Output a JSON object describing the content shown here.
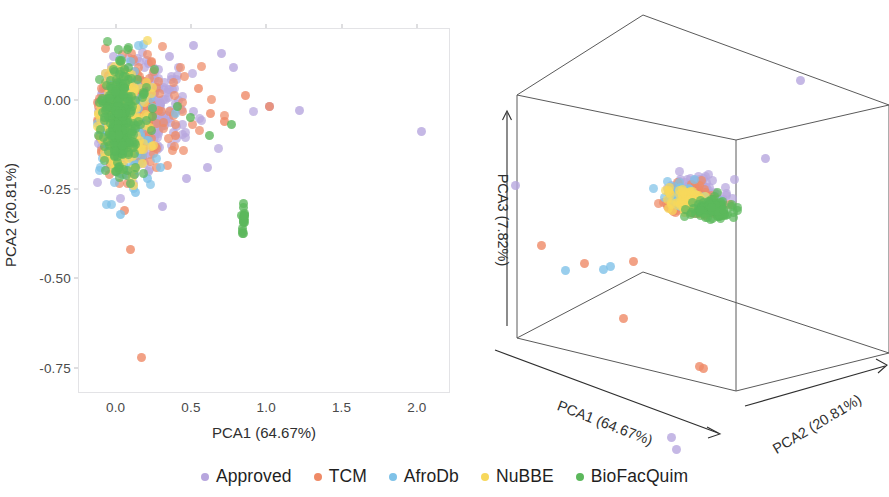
{
  "legend": {
    "position": "bottom-center",
    "items": [
      {
        "label": "Approved",
        "color": "#b7a6de"
      },
      {
        "label": "TCM",
        "color": "#ef8a66"
      },
      {
        "label": "AfroDb",
        "color": "#7fc2e8"
      },
      {
        "label": "NuBBE",
        "color": "#f7d85c"
      },
      {
        "label": "BioFacQuim",
        "color": "#5cb85c"
      }
    ]
  },
  "panel_2d": {
    "xlabel": "PCA1 (64.67%)",
    "ylabel": "PCA2 (20.81%)",
    "xticks": [
      "0.0",
      "0.5",
      "1.0",
      "1.5",
      "2.0"
    ],
    "yticks": [
      "0.00",
      "-0.25",
      "-0.50",
      "-0.75"
    ],
    "xlim": [
      -0.25,
      2.22
    ],
    "ylim": [
      -0.82,
      0.2
    ],
    "grid": false
  },
  "panel_3d": {
    "xlabel": "PCA1 (64.67%)",
    "ylabel": "PCA2 (20.81%)",
    "zlabel": "PCA3 (7.82%)",
    "box": true,
    "ticks": []
  },
  "chart_data": {
    "type": "scatter",
    "title": "",
    "panels": 2,
    "xlabel": "PCA1 (64.67%)",
    "ylabel": "PCA2 (20.81%)",
    "zlabel": "PCA3 (7.82%)",
    "xlim": [
      -0.25,
      2.22
    ],
    "ylim": [
      -0.82,
      0.2
    ],
    "grid": false,
    "legend_position": "bottom-center",
    "variance_explained": {
      "PCA1": 64.67,
      "PCA2": 20.81,
      "PCA3": 7.82
    },
    "series": [
      {
        "name": "Approved",
        "color": "#b7a6de",
        "n": 420,
        "center": [
          0.1,
          -0.04
        ],
        "spread": [
          0.2,
          0.075
        ],
        "outliers": [
          [
            2.03,
            -0.09
          ],
          [
            1.22,
            -0.03
          ],
          [
            1.02,
            -0.02
          ],
          [
            0.78,
            0.09
          ],
          [
            0.7,
            0.13
          ],
          [
            0.52,
            0.15
          ],
          [
            0.36,
            0.12
          ],
          [
            0.61,
            -0.19
          ],
          [
            0.47,
            -0.22
          ],
          [
            0.31,
            -0.3
          ],
          [
            0.22,
            0.1
          ]
        ]
      },
      {
        "name": "TCM",
        "color": "#ef8a66",
        "n": 330,
        "center": [
          0.09,
          -0.05
        ],
        "spread": [
          0.17,
          0.07
        ],
        "outliers": [
          [
            1.02,
            -0.02
          ],
          [
            0.86,
            0.01
          ],
          [
            0.72,
            -0.06
          ],
          [
            0.63,
            -0.04
          ],
          [
            0.55,
            0.03
          ],
          [
            0.17,
            -0.72
          ],
          [
            0.1,
            -0.42
          ],
          [
            0.06,
            -0.31
          ],
          [
            0.4,
            -0.1
          ]
        ]
      },
      {
        "name": "AfroDb",
        "color": "#7fc2e8",
        "n": 150,
        "center": [
          0.05,
          -0.08
        ],
        "spread": [
          0.1,
          0.08
        ],
        "outliers": [
          [
            0.3,
            -0.19
          ],
          [
            0.03,
            -0.32
          ],
          [
            0.13,
            -0.26
          ],
          [
            0.21,
            -0.22
          ]
        ]
      },
      {
        "name": "NuBBE",
        "color": "#f7d85c",
        "n": 300,
        "center": [
          0.03,
          -0.05
        ],
        "spread": [
          0.075,
          0.065
        ],
        "outliers": [
          [
            0.24,
            -0.13
          ],
          [
            0.18,
            -0.18
          ],
          [
            0.12,
            -0.24
          ]
        ]
      },
      {
        "name": "BioFacQuim",
        "color": "#5cb85c",
        "n": 280,
        "center": [
          0.03,
          -0.05
        ],
        "spread": [
          0.07,
          0.07
        ],
        "outliers": [
          [
            0.77,
            -0.07
          ],
          [
            0.62,
            -0.1
          ],
          [
            0.5,
            -0.05
          ],
          [
            0.41,
            -0.02
          ]
        ],
        "cluster": {
          "x": 0.85,
          "y": -0.345,
          "n": 16,
          "sx": 0.006,
          "sy": 0.022
        }
      }
    ],
    "series_3d": [
      {
        "name": "Approved",
        "color": "#b7a6de",
        "n": 200,
        "center": [
          0.55,
          0.42,
          0.6
        ],
        "spread": [
          0.045,
          0.04,
          0.05
        ],
        "outliers_px": [
          [
            345,
            72
          ],
          [
            310,
            150
          ],
          [
            60,
            177
          ],
          [
            216,
            429
          ],
          [
            221,
            441
          ]
        ]
      },
      {
        "name": "TCM",
        "color": "#ef8a66",
        "n": 190,
        "center": [
          0.52,
          0.44,
          0.56
        ],
        "spread": [
          0.05,
          0.042,
          0.046
        ],
        "outliers_px": [
          [
            86,
            237
          ],
          [
            244,
            358
          ],
          [
            248,
            360
          ],
          [
            178,
            253
          ],
          [
            129,
            255
          ],
          [
            168,
            310
          ]
        ]
      },
      {
        "name": "AfroDb",
        "color": "#7fc2e8",
        "n": 60,
        "center": [
          0.5,
          0.45,
          0.57
        ],
        "spread": [
          0.045,
          0.04,
          0.042
        ],
        "outliers_px": [
          [
            148,
            261
          ],
          [
            155,
            258
          ],
          [
            110,
            262
          ]
        ]
      },
      {
        "name": "NuBBE",
        "color": "#f7d85c",
        "n": 95,
        "center": [
          0.49,
          0.46,
          0.555
        ],
        "spread": [
          0.04,
          0.036,
          0.038
        ],
        "outliers_px": []
      },
      {
        "name": "BioFacQuim",
        "color": "#5cb85c",
        "n": 90,
        "center": [
          0.58,
          0.47,
          0.545
        ],
        "spread": [
          0.036,
          0.032,
          0.03
        ],
        "outliers_px": []
      }
    ]
  }
}
